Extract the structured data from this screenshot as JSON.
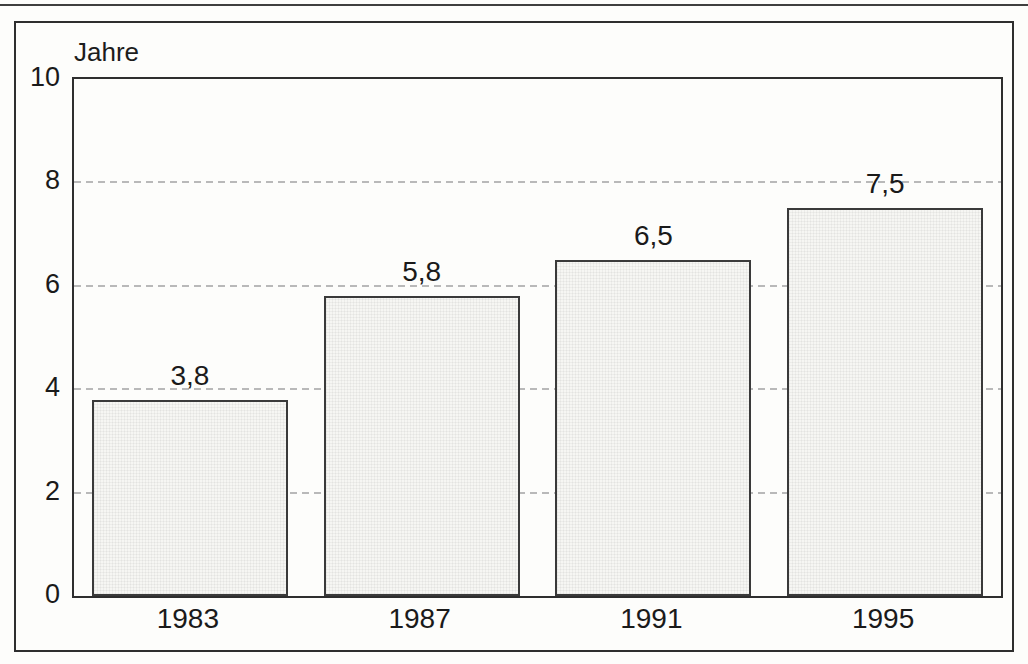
{
  "page": {
    "kind": "scanned statistical bar chart",
    "language": "German"
  },
  "colors": {
    "background": "#fdfdfb",
    "frame_line": "#2e2e2e",
    "bar_fill": "#f6f6f3",
    "bar_border": "#3a3a3a",
    "gridline": "#b9b9b9",
    "text": "#1a1a1a"
  },
  "chart_data": {
    "type": "bar",
    "title": "",
    "ylabel": "Jahre",
    "xlabel": "",
    "categories": [
      "1983",
      "1987",
      "1991",
      "1995"
    ],
    "values": [
      3.8,
      5.8,
      6.5,
      7.5
    ],
    "value_labels": [
      "3,8",
      "5,8",
      "6,5",
      "7,5"
    ],
    "ylim": [
      0,
      10
    ],
    "yticks": [
      0,
      2,
      4,
      6,
      8,
      10
    ],
    "ytick_labels": [
      "0",
      "2",
      "4",
      "6",
      "8",
      "10"
    ],
    "gridlines_at": [
      2,
      4,
      6,
      8
    ],
    "gridline_style": "dashed horizontal, drawn behind bars",
    "legend": "none",
    "bar_fill_description": "very light gray halftone texture with thin dark border"
  }
}
